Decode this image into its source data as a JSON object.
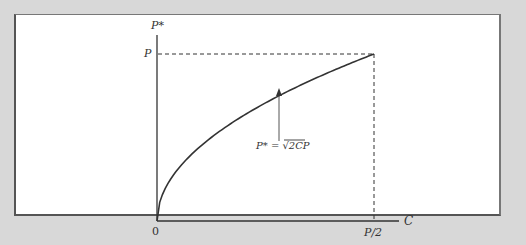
{
  "chart_data": {
    "type": "line",
    "title": "",
    "xlabel": "C",
    "ylabel": "P*",
    "x_ticks": [
      "0",
      "P/2"
    ],
    "y_ticks": [
      "P"
    ],
    "xlim": [
      "0",
      "P/2"
    ],
    "ylim": [
      "0",
      "P"
    ],
    "grid": false,
    "legend": null,
    "series": [
      {
        "name": "P* = √(2CP)",
        "formula": "P* = sqrt(2*C*P)",
        "x_normalized": [
          0,
          0.05,
          0.1,
          0.2,
          0.3,
          0.4,
          0.5,
          0.6,
          0.7,
          0.8,
          0.9,
          1.0
        ],
        "y_normalized": [
          0,
          0.224,
          0.316,
          0.447,
          0.548,
          0.632,
          0.707,
          0.775,
          0.837,
          0.894,
          0.949,
          1.0
        ]
      }
    ],
    "reference_lines": [
      {
        "type": "horizontal",
        "at": "P",
        "style": "dashed"
      },
      {
        "type": "vertical",
        "at": "P/2",
        "style": "dashed"
      }
    ],
    "annotations": [
      {
        "text": "P* = √2CP",
        "arrow_to": "curve",
        "x_normalized": 0.56
      }
    ]
  },
  "labels": {
    "y_axis": "P*",
    "x_axis": "C",
    "y_tick_p": "P",
    "x_tick_zero": "0",
    "x_tick_half": "P/2",
    "formula_lhs": "P* =",
    "formula_radical": "√",
    "formula_radicand": "2CP"
  },
  "colors": {
    "background": "#d8d8d8",
    "panel": "#ffffff",
    "ink": "#333333"
  }
}
